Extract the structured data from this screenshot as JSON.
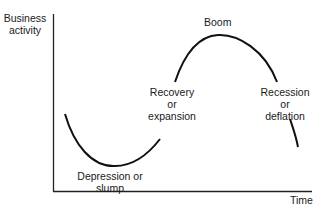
{
  "diagram": {
    "y_axis_label": [
      "Business",
      "activity"
    ],
    "x_axis_label": "Time",
    "phases": [
      {
        "name": "depression",
        "lines": [
          "Depression or",
          "slump"
        ]
      },
      {
        "name": "recovery",
        "lines": [
          "Recovery",
          "or",
          "expansion"
        ]
      },
      {
        "name": "boom",
        "lines": [
          "Boom"
        ]
      },
      {
        "name": "recession",
        "lines": [
          "Recession",
          "or",
          "deflation"
        ]
      }
    ],
    "colors": {
      "line": "#111111",
      "text": "#1a1a1a",
      "background": "#ffffff"
    }
  }
}
